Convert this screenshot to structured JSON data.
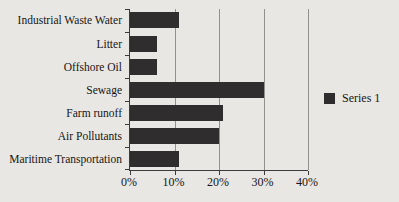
{
  "chart_data": {
    "type": "bar",
    "orientation": "horizontal",
    "title": "",
    "xlabel": "",
    "ylabel": "",
    "categories": [
      "Industrial Waste Water",
      "Litter",
      "Offshore Oil",
      "Sewage",
      "Farm runoff",
      "Air Pollutants",
      "Maritime Transportation"
    ],
    "series": [
      {
        "name": "Series 1",
        "values": [
          11,
          6,
          6,
          30,
          21,
          20,
          11
        ]
      }
    ],
    "xlim": [
      0,
      40
    ],
    "x_tick_labels": [
      "0%",
      "10%",
      "20%",
      "30%",
      "40%"
    ],
    "x_tick_values": [
      0,
      10,
      20,
      30,
      40
    ],
    "grid": "vertical",
    "legend_position": "right",
    "bar_color": "#2f2d2e",
    "gridline_color": "#928f8c",
    "axis_color": "#3c3a3a",
    "background_color": "#e9e7e3",
    "text_color": "#161616"
  },
  "legend": {
    "label": "Series 1",
    "swatch_color": "#2f2d2e"
  }
}
